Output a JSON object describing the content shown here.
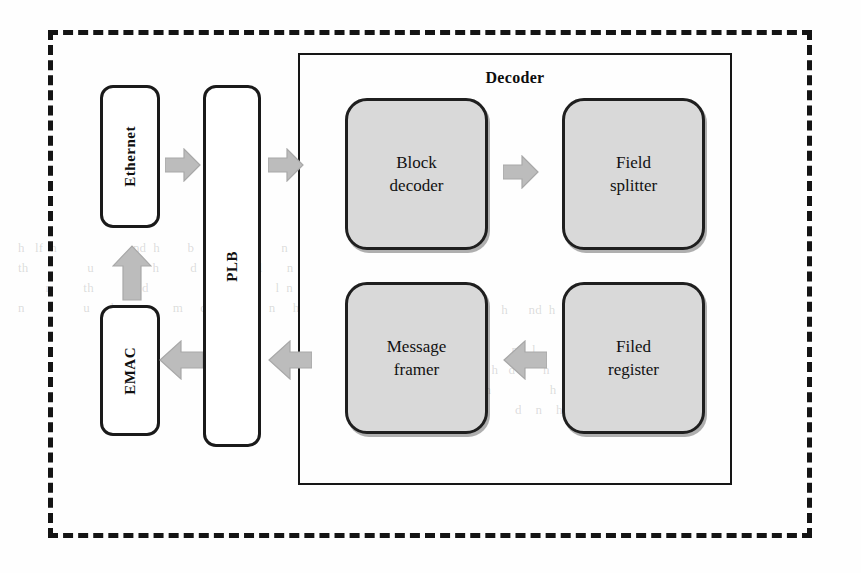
{
  "diagram": {
    "title": "Decoder",
    "boundary_style": "dashed",
    "external_blocks": [
      {
        "id": "ethernet",
        "label": "Ethernet",
        "orientation": "vertical"
      },
      {
        "id": "plb",
        "label": "PLB",
        "orientation": "vertical"
      },
      {
        "id": "emac",
        "label": "EMAC",
        "orientation": "vertical"
      }
    ],
    "decoder": {
      "label": "Decoder",
      "stages": [
        {
          "id": "block-decoder",
          "line1": "Block",
          "line2": "decoder"
        },
        {
          "id": "field-splitter",
          "line1": "Field",
          "line2": "splitter"
        },
        {
          "id": "message-framer",
          "line1": "Message",
          "line2": "framer"
        },
        {
          "id": "filed-register",
          "line1": "Filed",
          "line2": "register"
        }
      ]
    },
    "arrows": [
      {
        "id": "ethernet-to-plb",
        "direction": "right"
      },
      {
        "id": "plb-to-block-decoder",
        "direction": "right"
      },
      {
        "id": "block-decoder-to-field-splitter",
        "direction": "right"
      },
      {
        "id": "filed-register-to-message-framer",
        "direction": "left"
      },
      {
        "id": "message-framer-to-plb",
        "direction": "left"
      },
      {
        "id": "plb-to-emac",
        "direction": "left"
      },
      {
        "id": "emac-to-ethernet",
        "direction": "up"
      }
    ],
    "colors": {
      "stage_fill": "#d9d9d9",
      "stage_border": "#1f1f1f",
      "arrow_fill": "#bcbcbc",
      "line": "#141414",
      "background": "#ffffff"
    }
  },
  "page_background_text": {
    "top_block": "h   lf  h                      nd  h        b         f     h        n  \nth                 u                 h         d       n         l       n   \n        n         th          u  d                 und       b     l  n    \nn                 u     d                 m     d           d     n     h  ",
    "mid_block": "          h    n       n      b   u       h      nd  h      b  d\n        nd  b   d         m  h   n                              n    d\n  h   n   d  n            d                  n    l        h     n    \n            n           m                h   d        h       n    d  h\n          n           d  m            h                 h     n     \n        n   d       nd  h                     d    n    h      d     "
  }
}
